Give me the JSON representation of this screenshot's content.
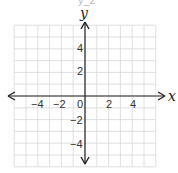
{
  "header_fragment": "y_2",
  "chart_data": {
    "type": "coordinate-grid",
    "title": "",
    "xlabel": "x",
    "ylabel": "y",
    "xlim": [
      -6,
      6
    ],
    "ylim": [
      -6,
      6
    ],
    "grid": true,
    "x_ticks": [
      {
        "label": "−4",
        "value": -4
      },
      {
        "label": "−2",
        "value": -2
      },
      {
        "label": "0",
        "value": 0
      },
      {
        "label": "2",
        "value": 2
      },
      {
        "label": "4",
        "value": 4
      }
    ],
    "y_ticks": [
      {
        "label": "4",
        "value": 4
      },
      {
        "label": "2",
        "value": 2
      },
      {
        "label": "−2",
        "value": -2
      },
      {
        "label": "−4",
        "value": -4
      }
    ],
    "series": []
  },
  "colors": {
    "grid": "#d8d8d8",
    "axis": "#222222",
    "text": "#333333"
  }
}
